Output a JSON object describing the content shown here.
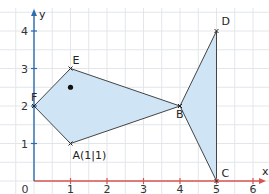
{
  "diagram": {
    "type": "coordinate-system-fish",
    "axes": {
      "x_label": "x",
      "y_label": "y",
      "origin_label": "0",
      "x_ticks": [
        "1",
        "2",
        "3",
        "4",
        "5",
        "6"
      ],
      "y_ticks": [
        "1",
        "2",
        "3",
        "4"
      ],
      "x_axis_color": "#d9534f",
      "y_axis_color": "#2b6cb0"
    },
    "grid": {
      "color": "#e2e6ea",
      "step": 0.5
    },
    "fill_color": "#cfe4f5",
    "points": [
      {
        "name": "A",
        "label": "A(1|1)",
        "x": 1,
        "y": 1
      },
      {
        "name": "B",
        "label": "B",
        "x": 4,
        "y": 2
      },
      {
        "name": "C",
        "label": "C",
        "x": 5,
        "y": 0
      },
      {
        "name": "D",
        "label": "D",
        "x": 5,
        "y": 4
      },
      {
        "name": "E",
        "label": "E",
        "x": 1,
        "y": 3
      },
      {
        "name": "F",
        "label": "F",
        "x": 0,
        "y": 2
      }
    ],
    "eye": {
      "x": 1,
      "y": 2.5
    }
  }
}
